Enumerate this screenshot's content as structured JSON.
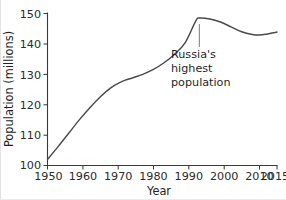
{
  "chart_data": {
    "type": "line",
    "title": "",
    "xlabel": "Year",
    "ylabel": "Population (millions)",
    "xlim": [
      1950,
      2015
    ],
    "ylim": [
      100,
      150
    ],
    "grid": false,
    "legend": null,
    "x_ticks": [
      1950,
      1960,
      1970,
      1980,
      1990,
      2000,
      2010,
      2015
    ],
    "x_tick_labels": [
      "1950",
      "1960",
      "1970",
      "1980",
      "1990",
      "2000",
      "2010",
      "2015"
    ],
    "y_ticks": [
      100,
      110,
      120,
      130,
      140,
      150
    ],
    "y_tick_labels": [
      "100",
      "110",
      "120",
      "130",
      "140",
      "150"
    ],
    "series": [
      {
        "name": "Russia population",
        "color": "#4a4a4a",
        "x": [
          1950,
          1953,
          1956,
          1959,
          1962,
          1965,
          1968,
          1971,
          1974,
          1977,
          1980,
          1983,
          1986,
          1989,
          1992,
          1993,
          1996,
          1999,
          2002,
          2005,
          2008,
          2010,
          2012,
          2015
        ],
        "values": [
          102.0,
          106.2,
          110.6,
          115.0,
          119.0,
          122.6,
          125.6,
          127.6,
          128.8,
          130.0,
          131.6,
          133.8,
          136.6,
          140.4,
          147.6,
          148.5,
          148.2,
          147.2,
          145.6,
          144.0,
          143.1,
          142.9,
          143.2,
          143.9
        ]
      }
    ],
    "annotations": [
      {
        "name": "peak-annotation",
        "lines": [
          "Russia's",
          "highest",
          "population"
        ],
        "points_to_x": 1993,
        "points_to_y": 148.5
      }
    ]
  },
  "axes": {
    "y_title": "Population (millions)",
    "x_title": "Year"
  },
  "annotation": {
    "line1": "Russia's",
    "line2": "highest",
    "line3": "population"
  },
  "ticks": {
    "y": [
      "100",
      "110",
      "120",
      "130",
      "140",
      "150"
    ],
    "x": [
      "1950",
      "1960",
      "1970",
      "1980",
      "1990",
      "2000",
      "2010",
      "2015"
    ]
  }
}
